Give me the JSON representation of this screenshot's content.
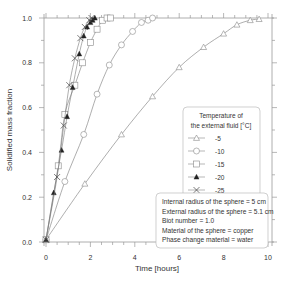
{
  "chart_data": {
    "type": "line",
    "title": "",
    "xlabel": "Time [hours]",
    "ylabel": "Solidified mass fraction",
    "xlim": [
      0,
      10
    ],
    "ylim": [
      0,
      1.0
    ],
    "xticks": [
      "0",
      "2",
      "4",
      "6",
      "8",
      "10"
    ],
    "yticks": [
      "0.0",
      "0.2",
      "0.4",
      "0.6",
      "0.8",
      "1.0"
    ],
    "grid": false,
    "legend_title": [
      "Temperature of",
      "the external fluid [°C]"
    ],
    "legend_position": "right-middle",
    "series": [
      {
        "name": "-5",
        "marker": "triangle-open",
        "x": [
          0,
          1.75,
          3.4,
          4.8,
          6.0,
          7.1,
          8.0,
          8.6,
          9.2,
          9.6
        ],
        "y": [
          0.01,
          0.26,
          0.48,
          0.65,
          0.78,
          0.87,
          0.93,
          0.97,
          0.99,
          0.995
        ]
      },
      {
        "name": "-10",
        "marker": "circle-open",
        "x": [
          0,
          0.85,
          1.7,
          2.3,
          2.85,
          3.4,
          3.9,
          4.3,
          4.6,
          4.8
        ],
        "y": [
          0.01,
          0.27,
          0.48,
          0.66,
          0.79,
          0.88,
          0.94,
          0.98,
          0.99,
          1.0
        ]
      },
      {
        "name": "-15",
        "marker": "square-open",
        "x": [
          0,
          0.55,
          0.85,
          1.3,
          1.65,
          2.0,
          2.3,
          2.55,
          2.75,
          2.9
        ],
        "y": [
          0.01,
          0.34,
          0.57,
          0.7,
          0.8,
          0.89,
          0.95,
          0.99,
          1.0,
          1.0
        ]
      },
      {
        "name": "-20",
        "marker": "triangle-filled",
        "x": [
          0,
          0.35,
          0.7,
          0.95,
          1.2,
          1.5,
          1.7,
          1.85,
          2.0,
          2.1,
          2.2
        ],
        "y": [
          0.01,
          0.22,
          0.41,
          0.56,
          0.69,
          0.84,
          0.92,
          0.96,
          0.98,
          0.99,
          1.0
        ]
      },
      {
        "name": "-25",
        "marker": "x",
        "x": [
          0,
          0.5,
          0.8,
          1.05,
          1.3,
          1.55,
          1.75,
          1.95,
          2.05
        ],
        "y": [
          0.01,
          0.29,
          0.52,
          0.7,
          0.82,
          0.91,
          0.96,
          0.99,
          1.0
        ]
      }
    ],
    "annotation": [
      "Internal radius of the sphere = 5 cm",
      "External radius of the sphere = 5.1 cm",
      "Biot number = 1.0",
      "Material of the sphere = copper",
      "Phase change material = water"
    ]
  }
}
